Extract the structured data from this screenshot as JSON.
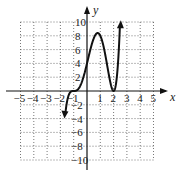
{
  "chart_data": {
    "type": "line",
    "title": "",
    "xlabel": "x",
    "ylabel": "y",
    "xlim": [
      -5,
      5
    ],
    "ylim": [
      -10,
      10
    ],
    "grid": true,
    "x_ticks": [
      "-5",
      "-4",
      "-3",
      "-2",
      "-1",
      "1",
      "2",
      "3",
      "4",
      "5"
    ],
    "y_ticks": [
      "10",
      "8",
      "6",
      "4",
      "2",
      "-2",
      "-4",
      "-6",
      "-8",
      "-10"
    ],
    "function": "f(x) = (x+1)^3 (x-2)^2",
    "series": [
      {
        "name": "f(x)",
        "x": [
          -1.5,
          -1.25,
          -1,
          -0.5,
          0,
          0.5,
          0.8,
          1,
          1.5,
          2,
          2.25,
          2.45
        ],
        "y": [
          -2.9,
          -0.08,
          0,
          0.78,
          4,
          7.6,
          8.4,
          8,
          3.9,
          0,
          2.3,
          8.8
        ]
      }
    ],
    "annotations": [
      "arrow down at left end",
      "arrow up at right end"
    ]
  }
}
